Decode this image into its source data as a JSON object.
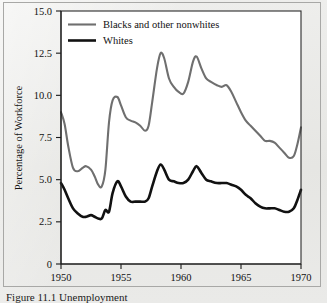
{
  "figure": {
    "caption": "Figure 11.1  Unemployment",
    "background_color": "#e9e9e7",
    "plot_background_color": "#ffffff",
    "frame_color": "#a8a8a6"
  },
  "chart_data": {
    "type": "line",
    "title": "",
    "xlabel": "",
    "ylabel": "Percentage of Workforce",
    "xlim": [
      1950,
      1970
    ],
    "ylim": [
      0,
      15.0
    ],
    "grid": false,
    "legend_position": "top-left-inside",
    "xticks": [
      1950,
      1955,
      1960,
      1965,
      1970
    ],
    "xtick_labels": [
      "1950",
      "1955",
      "1960",
      "1965",
      "1970"
    ],
    "yticks": [
      0,
      2.5,
      5.0,
      7.5,
      10.0,
      12.5,
      15.0
    ],
    "ytick_labels": [
      "0",
      "2.5",
      "5.0",
      "7.5",
      "10.0",
      "12.5",
      "15.0"
    ],
    "x": [
      1950.0,
      1950.3,
      1950.6,
      1951.0,
      1951.4,
      1951.8,
      1952.1,
      1952.5,
      1952.8,
      1953.1,
      1953.4,
      1953.7,
      1954.0,
      1954.3,
      1954.7,
      1955.0,
      1955.4,
      1955.8,
      1956.2,
      1956.6,
      1957.0,
      1957.3,
      1957.6,
      1958.0,
      1958.3,
      1958.6,
      1959.0,
      1959.4,
      1959.8,
      1960.2,
      1960.6,
      1961.0,
      1961.3,
      1961.7,
      1962.1,
      1962.5,
      1963.0,
      1963.4,
      1963.8,
      1964.2,
      1964.6,
      1965.0,
      1965.4,
      1965.8,
      1966.2,
      1966.6,
      1967.0,
      1967.4,
      1967.8,
      1968.2,
      1968.6,
      1969.0,
      1969.4,
      1969.7,
      1970.0
    ],
    "series": [
      {
        "name": "Blacks and other nonwhites",
        "color": "#6f6f6f",
        "line_width": 2.1,
        "values": [
          9.0,
          8.3,
          7.0,
          5.7,
          5.5,
          5.7,
          5.8,
          5.6,
          5.2,
          4.7,
          4.6,
          5.6,
          8.4,
          9.7,
          9.9,
          9.4,
          8.7,
          8.5,
          8.4,
          8.2,
          7.9,
          8.2,
          9.6,
          11.6,
          12.5,
          12.2,
          11.0,
          10.5,
          10.2,
          10.1,
          10.8,
          12.0,
          12.3,
          11.6,
          11.0,
          10.8,
          10.6,
          10.5,
          10.6,
          10.2,
          9.6,
          9.0,
          8.5,
          8.2,
          7.9,
          7.6,
          7.3,
          7.3,
          7.2,
          6.9,
          6.6,
          6.3,
          6.4,
          7.1,
          8.1
        ]
      },
      {
        "name": "Whites",
        "color": "#111111",
        "line_width": 2.6,
        "values": [
          4.8,
          4.4,
          3.9,
          3.3,
          3.0,
          2.8,
          2.8,
          2.9,
          2.8,
          2.7,
          2.7,
          3.2,
          3.1,
          4.2,
          4.9,
          4.6,
          4.0,
          3.7,
          3.7,
          3.7,
          3.7,
          3.9,
          4.6,
          5.5,
          5.9,
          5.6,
          5.0,
          4.9,
          4.8,
          4.8,
          5.0,
          5.5,
          5.8,
          5.4,
          5.0,
          4.9,
          4.8,
          4.8,
          4.8,
          4.7,
          4.6,
          4.4,
          4.1,
          3.9,
          3.6,
          3.4,
          3.3,
          3.3,
          3.3,
          3.2,
          3.1,
          3.1,
          3.3,
          3.8,
          4.4
        ]
      }
    ],
    "legend": [
      {
        "label": "Blacks and other nonwhites",
        "color": "#6f6f6f"
      },
      {
        "label": "Whites",
        "color": "#111111"
      }
    ]
  }
}
